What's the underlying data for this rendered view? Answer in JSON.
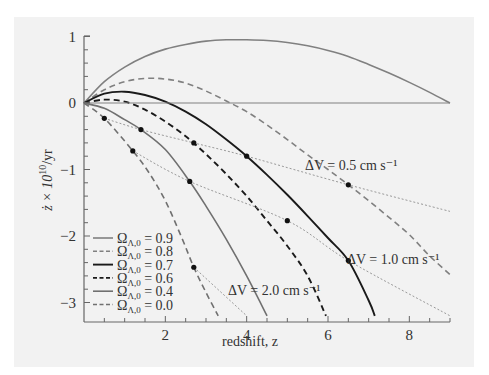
{
  "chart_data": {
    "type": "line",
    "title": "",
    "xlabel": "redshift, z",
    "ylabel": "ż × 10^10/yr",
    "xlim": [
      0,
      9
    ],
    "ylim": [
      -3.2,
      1.05
    ],
    "x_ticks": [
      "2",
      "4",
      "6",
      "8"
    ],
    "y_ticks": [
      "1",
      "0",
      "−1",
      "−2",
      "−3"
    ],
    "grid": false,
    "legend_position": "lower-left",
    "series": [
      {
        "name": "Ω_Λ,0 = 0.9",
        "style": "solid",
        "color": "#808080",
        "x": [
          0,
          0.5,
          1,
          1.5,
          2,
          2.5,
          3,
          3.5,
          4,
          4.5,
          5,
          5.5,
          6,
          6.5,
          7,
          7.5,
          8,
          8.5,
          9
        ],
        "y": [
          0,
          0.32,
          0.54,
          0.7,
          0.81,
          0.88,
          0.93,
          0.95,
          0.95,
          0.94,
          0.91,
          0.86,
          0.79,
          0.7,
          0.58,
          0.45,
          0.31,
          0.16,
          0
        ]
      },
      {
        "name": "Ω_Λ,0 = 0.8",
        "style": "dashed",
        "color": "#808080",
        "x": [
          0,
          0.5,
          1,
          1.5,
          2,
          2.5,
          3,
          3.5,
          4,
          4.5,
          5,
          5.5,
          6,
          6.5,
          7,
          7.5,
          8,
          8.5,
          9
        ],
        "y": [
          0,
          0.2,
          0.32,
          0.37,
          0.36,
          0.3,
          0.18,
          0.03,
          -0.13,
          -0.33,
          -0.55,
          -0.78,
          -1.0,
          -1.23,
          -1.47,
          -1.72,
          -1.98,
          -2.3,
          -2.58
        ]
      },
      {
        "name": "Ω_Λ,0 = 0.7",
        "style": "solid",
        "color": "#1a1a1a",
        "x": [
          0,
          0.5,
          1,
          1.5,
          2,
          2.5,
          3,
          3.5,
          4,
          4.5,
          5,
          5.5,
          6,
          6.5,
          7,
          7.15
        ],
        "y": [
          0,
          0.14,
          0.17,
          0.12,
          0.02,
          -0.13,
          -0.32,
          -0.55,
          -0.8,
          -1.08,
          -1.38,
          -1.7,
          -2.03,
          -2.37,
          -2.97,
          -3.2
        ]
      },
      {
        "name": "Ω_Λ,0 = 0.6",
        "style": "dashed",
        "color": "#1a1a1a",
        "x": [
          0,
          0.5,
          1,
          1.5,
          2,
          2.5,
          3,
          3.5,
          4,
          4.5,
          5,
          5.5,
          5.95
        ],
        "y": [
          0,
          0.05,
          0.02,
          -0.1,
          -0.28,
          -0.5,
          -0.77,
          -1.07,
          -1.4,
          -1.77,
          -2.15,
          -2.6,
          -3.2
        ]
      },
      {
        "name": "Ω_Λ,0 = 0.4",
        "style": "solid",
        "color": "#707070",
        "x": [
          0,
          0.5,
          1,
          1.4,
          2,
          2.6,
          3,
          3.5,
          4,
          4.5
        ],
        "y": [
          0,
          -0.08,
          -0.25,
          -0.4,
          -0.7,
          -1.18,
          -1.55,
          -2.05,
          -2.6,
          -3.2
        ]
      },
      {
        "name": "Ω_Λ,0 = 0.0",
        "style": "dashed",
        "color": "#707070",
        "x": [
          0,
          0.5,
          1.2,
          1.6,
          2,
          2.4,
          2.7,
          3.0,
          3.3
        ],
        "y": [
          0,
          -0.23,
          -0.72,
          -1.05,
          -1.47,
          -2.02,
          -2.47,
          -2.85,
          -3.2
        ]
      },
      {
        "name": "zero line",
        "style": "solid-thin",
        "color": "#808080",
        "x": [
          0,
          9
        ],
        "y": [
          0,
          0
        ]
      }
    ],
    "iso_lines": [
      {
        "label": "ΔV = 0.5 cm s⁻¹",
        "style": "dotted",
        "points": [
          [
            0.5,
            -0.23
          ],
          [
            1.4,
            -0.4
          ],
          [
            2.7,
            -0.6
          ],
          [
            4.0,
            -0.8
          ],
          [
            6.5,
            -1.23
          ],
          [
            9.0,
            -1.63
          ]
        ]
      },
      {
        "label": "ΔV = 1.0 cm s⁻¹",
        "style": "dotted",
        "points": [
          [
            1.2,
            -0.72
          ],
          [
            2.6,
            -1.18
          ],
          [
            5.0,
            -1.77
          ],
          [
            6.5,
            -2.37
          ],
          [
            9.0,
            -3.2
          ]
        ]
      },
      {
        "label": "ΔV = 2.0 cm s⁻¹",
        "style": "dotted",
        "points": [
          [
            2.7,
            -2.47
          ],
          [
            4.0,
            -3.2
          ]
        ]
      }
    ],
    "markers": [
      [
        0.5,
        -0.23
      ],
      [
        1.4,
        -0.4
      ],
      [
        2.7,
        -0.6
      ],
      [
        4.0,
        -0.8
      ],
      [
        6.5,
        -1.23
      ],
      [
        1.2,
        -0.72
      ],
      [
        2.6,
        -1.18
      ],
      [
        5.0,
        -1.77
      ],
      [
        6.5,
        -2.37
      ],
      [
        2.7,
        -2.47
      ]
    ]
  },
  "labels": {
    "xlabel": "redshift, z",
    "ylabel_main": "ż × 10",
    "ylabel_exp": "10",
    "ylabel_tail": "/yr",
    "ann_05": "ΔV = 0.5 cm s⁻¹",
    "ann_10": "ΔV = 1.0 cm s⁻¹",
    "ann_20": "ΔV = 2.0 cm s⁻¹"
  },
  "legend": [
    {
      "label": "Ω",
      "sub": "Λ,0",
      "value": " = 0.9"
    },
    {
      "label": "Ω",
      "sub": "Λ,0",
      "value": " = 0.8"
    },
    {
      "label": "Ω",
      "sub": "Λ,0",
      "value": " = 0.7"
    },
    {
      "label": "Ω",
      "sub": "Λ,0",
      "value": " = 0.6"
    },
    {
      "label": "Ω",
      "sub": "Λ,0",
      "value": " = 0.4"
    },
    {
      "label": "Ω",
      "sub": "Λ,0",
      "value": " = 0.0"
    }
  ]
}
